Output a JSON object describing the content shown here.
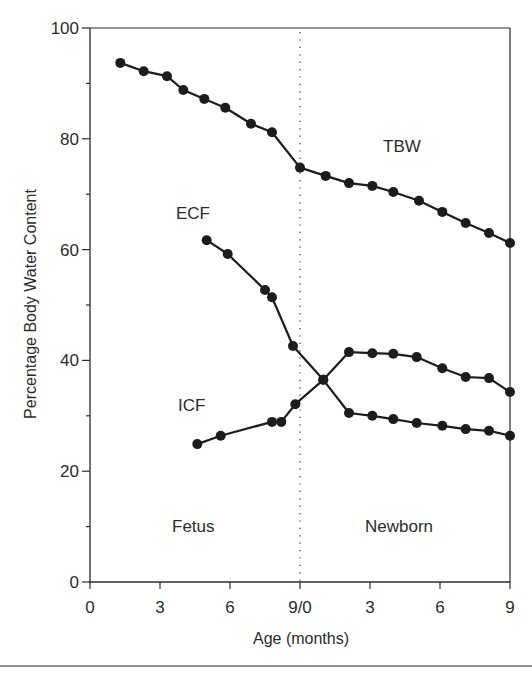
{
  "chart_data": {
    "type": "line",
    "title": "",
    "xlabel": "Age (months)",
    "ylabel": "Percentage Body Water Content",
    "xlim": [
      0,
      18
    ],
    "ylim": [
      0,
      100
    ],
    "grid": false,
    "legend": "none (series labeled inline)",
    "x_ticks": [
      {
        "pos": 0,
        "label": "0"
      },
      {
        "pos": 3,
        "label": "3"
      },
      {
        "pos": 6,
        "label": "6"
      },
      {
        "pos": 9,
        "label": "9/0"
      },
      {
        "pos": 12,
        "label": "3"
      },
      {
        "pos": 15,
        "label": "6"
      },
      {
        "pos": 18,
        "label": "9"
      }
    ],
    "y_ticks": [
      {
        "pos": 0,
        "label": "0"
      },
      {
        "pos": 20,
        "label": "20"
      },
      {
        "pos": 40,
        "label": "40"
      },
      {
        "pos": 60,
        "label": "60"
      },
      {
        "pos": 80,
        "label": "80"
      },
      {
        "pos": 100,
        "label": "100"
      }
    ],
    "y_minor_ticks": [
      10,
      30,
      50,
      70,
      90
    ],
    "divider": {
      "x": 9,
      "style": "dotted",
      "meaning": "birth (fetus | newborn)"
    },
    "x_note": "x is a continuous timeline: 0-9 = fetal months, 9-18 = newborn months 0-9",
    "series": [
      {
        "name": "TBW",
        "points": [
          [
            1.3,
            93.7
          ],
          [
            2.3,
            92.2
          ],
          [
            3.3,
            91.3
          ],
          [
            4.0,
            88.8
          ],
          [
            4.9,
            87.2
          ],
          [
            5.8,
            85.6
          ],
          [
            6.9,
            82.7
          ],
          [
            7.8,
            81.2
          ],
          [
            9.0,
            74.8
          ],
          [
            10.1,
            73.3
          ],
          [
            11.1,
            72.0
          ],
          [
            12.1,
            71.5
          ],
          [
            13.0,
            70.4
          ],
          [
            14.1,
            68.8
          ],
          [
            15.1,
            66.8
          ],
          [
            16.1,
            64.8
          ],
          [
            17.1,
            63.0
          ],
          [
            18.0,
            61.2
          ]
        ]
      },
      {
        "name": "ECF",
        "points": [
          [
            5.0,
            61.7
          ],
          [
            5.9,
            59.2
          ],
          [
            7.5,
            52.7
          ],
          [
            7.8,
            51.4
          ],
          [
            8.7,
            42.6
          ],
          [
            10.0,
            36.5
          ],
          [
            11.1,
            30.5
          ],
          [
            12.1,
            30.0
          ],
          [
            13.0,
            29.4
          ],
          [
            14.0,
            28.7
          ],
          [
            15.1,
            28.2
          ],
          [
            16.1,
            27.6
          ],
          [
            17.1,
            27.3
          ],
          [
            18.0,
            26.4
          ]
        ]
      },
      {
        "name": "ICF",
        "points": [
          [
            4.6,
            24.9
          ],
          [
            5.6,
            26.4
          ],
          [
            7.8,
            28.9
          ],
          [
            8.2,
            28.9
          ],
          [
            8.8,
            32.1
          ],
          [
            10.0,
            36.5
          ],
          [
            11.1,
            41.5
          ],
          [
            12.1,
            41.3
          ],
          [
            13.0,
            41.2
          ],
          [
            14.0,
            40.6
          ],
          [
            15.1,
            38.6
          ],
          [
            16.1,
            37.0
          ],
          [
            17.1,
            36.8
          ],
          [
            18.0,
            34.3
          ]
        ]
      }
    ],
    "annotations": [
      {
        "text": "TBW",
        "x": 13.8,
        "y": 78.5
      },
      {
        "text": "ECF",
        "x": 5.2,
        "y": 66.5
      },
      {
        "text": "ICF",
        "x": 5.2,
        "y": 31.5
      },
      {
        "text": "Fetus",
        "x": 5.7,
        "y": 10
      },
      {
        "text": "Newborn",
        "x": 14.6,
        "y": 10
      }
    ]
  },
  "labels": {
    "xlabel": "Age (months)",
    "ylabel": "Percentage Body Water Content",
    "tbw": "TBW",
    "ecf": "ECF",
    "icf": "ICF",
    "fetus": "Fetus",
    "newborn": "Newborn"
  },
  "colors": {
    "line": "#1c1c1c",
    "axis": "#2b2b2b",
    "background": "#ffffff"
  }
}
